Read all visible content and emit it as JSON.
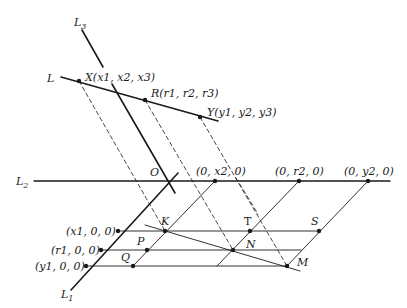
{
  "diagram": {
    "lines": {
      "L": "L",
      "L1": "L",
      "L1_sub": "1",
      "L2": "L",
      "L2_sub": "2",
      "L3": "L",
      "L3_sub": "3"
    },
    "points": {
      "X": {
        "name": "X",
        "coords": "(x1, x2, x3)"
      },
      "R": {
        "name": "R",
        "coords": "(r1, r2, r3)"
      },
      "Y": {
        "name": "Y",
        "coords": "(y1, y2, y3)"
      },
      "O": {
        "name": "O"
      },
      "K": {
        "name": "K"
      },
      "T": {
        "name": "T"
      },
      "S": {
        "name": "S"
      },
      "P": {
        "name": "P"
      },
      "N": {
        "name": "N"
      },
      "Q": {
        "name": "Q"
      },
      "M": {
        "name": "M"
      }
    },
    "axis_labels": {
      "x2_on_L2": "(0, x2, 0)",
      "r2_on_L2": "(0, r2, 0)",
      "y2_on_L2": "(0, y2, 0)",
      "x1_on_L1": "(x1, 0, 0)",
      "r1_on_L1": "(r1, 0, 0)",
      "y1_on_L1": "(y1, 0, 0)"
    },
    "colors": {
      "ink": "#1a1a1a",
      "background": "#ffffff"
    }
  }
}
